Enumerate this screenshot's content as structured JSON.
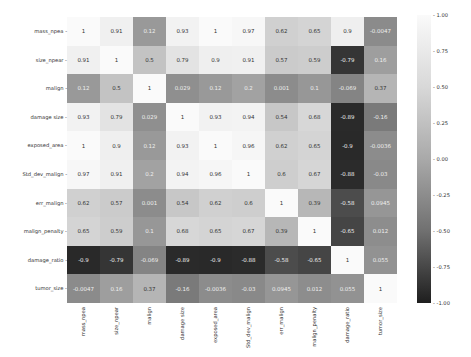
{
  "chart_data": {
    "type": "heatmap",
    "title": "",
    "labels": [
      "mass_npea",
      "size_npear",
      "malign",
      "damage size",
      "exposed_area",
      "Std_dev_malign",
      "err_malign",
      "malign_penalty",
      "damage_ratio",
      "tumor_size"
    ],
    "matrix": [
      [
        1,
        0.91,
        0.12,
        0.93,
        1,
        0.97,
        0.62,
        0.65,
        0.9,
        -0.0047
      ],
      [
        0.91,
        1,
        0.5,
        0.79,
        0.9,
        0.91,
        0.57,
        0.59,
        -0.79,
        0.16
      ],
      [
        0.12,
        0.5,
        1,
        0.029,
        0.12,
        0.2,
        0.001,
        0.1,
        -0.069,
        0.37
      ],
      [
        0.93,
        0.79,
        0.029,
        1,
        0.93,
        0.94,
        0.54,
        0.68,
        -0.89,
        -0.16
      ],
      [
        1,
        0.9,
        0.12,
        0.93,
        1,
        0.96,
        0.62,
        0.65,
        -0.9,
        -0.0036
      ],
      [
        0.97,
        0.91,
        0.2,
        0.94,
        0.96,
        1,
        0.6,
        0.67,
        -0.88,
        -0.03
      ],
      [
        0.62,
        0.57,
        0.001,
        0.54,
        0.62,
        0.6,
        1,
        0.39,
        -0.58,
        0.0945
      ],
      [
        0.65,
        0.59,
        0.1,
        0.68,
        0.65,
        0.67,
        0.39,
        1,
        -0.65,
        0.012
      ],
      [
        -0.9,
        -0.79,
        -0.069,
        -0.89,
        -0.9,
        -0.88,
        -0.58,
        -0.65,
        1,
        0.055
      ],
      [
        -0.0047,
        0.16,
        0.37,
        -0.16,
        -0.0036,
        -0.03,
        0.0945,
        0.012,
        0.055,
        1
      ]
    ],
    "display": [
      [
        "1",
        "0.91",
        "0.12",
        "0.93",
        "1",
        "0.97",
        "0.62",
        "0.65",
        "0.9",
        "-0.0047"
      ],
      [
        "0.91",
        "1",
        "0.5",
        "0.79",
        "0.9",
        "0.91",
        "0.57",
        "0.59",
        "-0.79",
        "0.16"
      ],
      [
        "0.12",
        "0.5",
        "1",
        "0.029",
        "0.12",
        "0.2",
        "0.001",
        "0.1",
        "-0.069",
        "0.37"
      ],
      [
        "0.93",
        "0.79",
        "0.029",
        "1",
        "0.93",
        "0.94",
        "0.54",
        "0.68",
        "-0.89",
        "-0.16"
      ],
      [
        "1",
        "0.9",
        "0.12",
        "0.93",
        "1",
        "0.96",
        "0.62",
        "0.65",
        "-0.9",
        "-0.0036"
      ],
      [
        "0.97",
        "0.91",
        "0.2",
        "0.94",
        "0.96",
        "1",
        "0.6",
        "0.67",
        "-0.88",
        "-0.03"
      ],
      [
        "0.62",
        "0.57",
        "0.001",
        "0.54",
        "0.62",
        "0.6",
        "1",
        "0.39",
        "-0.58",
        "0.0945"
      ],
      [
        "0.65",
        "0.59",
        "0.1",
        "0.68",
        "0.65",
        "0.67",
        "0.39",
        "1",
        "-0.65",
        "0.012"
      ],
      [
        "-0.9",
        "-0.79",
        "-0.069",
        "-0.89",
        "-0.9",
        "-0.88",
        "-0.58",
        "-0.65",
        "1",
        "0.055"
      ],
      [
        "-0.0047",
        "0.16",
        "0.37",
        "-0.16",
        "-0.0036",
        "-0.03",
        "0.0945",
        "0.012",
        "0.055",
        "1"
      ]
    ],
    "colorbar": {
      "ticks": [
        "1.00",
        "0.75",
        "0.50",
        "0.25",
        "0.00",
        "-0.25",
        "-0.50",
        "-0.75",
        "-1.00"
      ],
      "range": [
        -1,
        1
      ],
      "colormap": "grayscale"
    },
    "xlabel": "",
    "ylabel": ""
  }
}
